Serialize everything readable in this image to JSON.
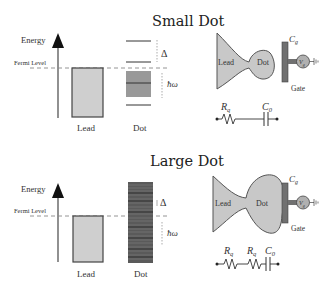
{
  "panels": [
    {
      "title": "Small Dot",
      "energy_axis_label": "Energy",
      "fermi_label": "Fermi Level",
      "lead_label": "Lead",
      "dot_label": "Dot",
      "delta_label": "Δ",
      "hw_label": "ħω",
      "device": {
        "lead": "Lead",
        "dot": "Dot",
        "gate": "Gate",
        "cg": "C",
        "cg_sub": "g",
        "vg": "V",
        "vg_sub": "g"
      },
      "circuit": {
        "r1": "R",
        "r1_sub": "q",
        "c0": "C",
        "c0_sub": "0"
      }
    },
    {
      "title": "Large Dot",
      "energy_axis_label": "Energy",
      "fermi_label": "Fermi Level",
      "lead_label": "Lead",
      "dot_label": "Dot",
      "delta_label": "Δ",
      "hw_label": "ħω",
      "device": {
        "lead": "Lead",
        "dot": "Dot",
        "gate": "Gate",
        "cg": "C",
        "cg_sub": "g",
        "vg": "V",
        "vg_sub": "g"
      },
      "circuit": {
        "r1": "R",
        "r1_sub": "q",
        "r2": "R",
        "r2_sub": "q",
        "c0": "C",
        "c0_sub": "0"
      }
    }
  ],
  "colors": {
    "lead_fill": "#cfcfcf",
    "dot_fill": "#c8c8c8",
    "gate_fill": "#707070",
    "level_line": "#333333",
    "band_fill": "#999999",
    "dense_band": "#555555"
  }
}
